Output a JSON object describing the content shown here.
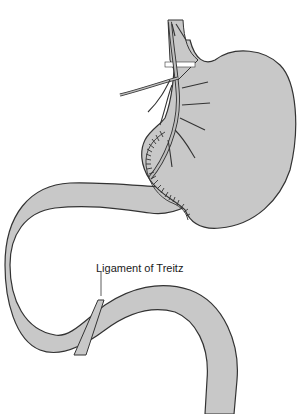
{
  "diagram": {
    "labels": [
      {
        "id": "ligament-of-treitz",
        "text": "Ligament of Treitz"
      }
    ],
    "colors": {
      "organ_fill": "#c8c8c8",
      "outline": "#333333",
      "background": "#ffffff",
      "vessel_fill": "#bdbdbd"
    }
  }
}
